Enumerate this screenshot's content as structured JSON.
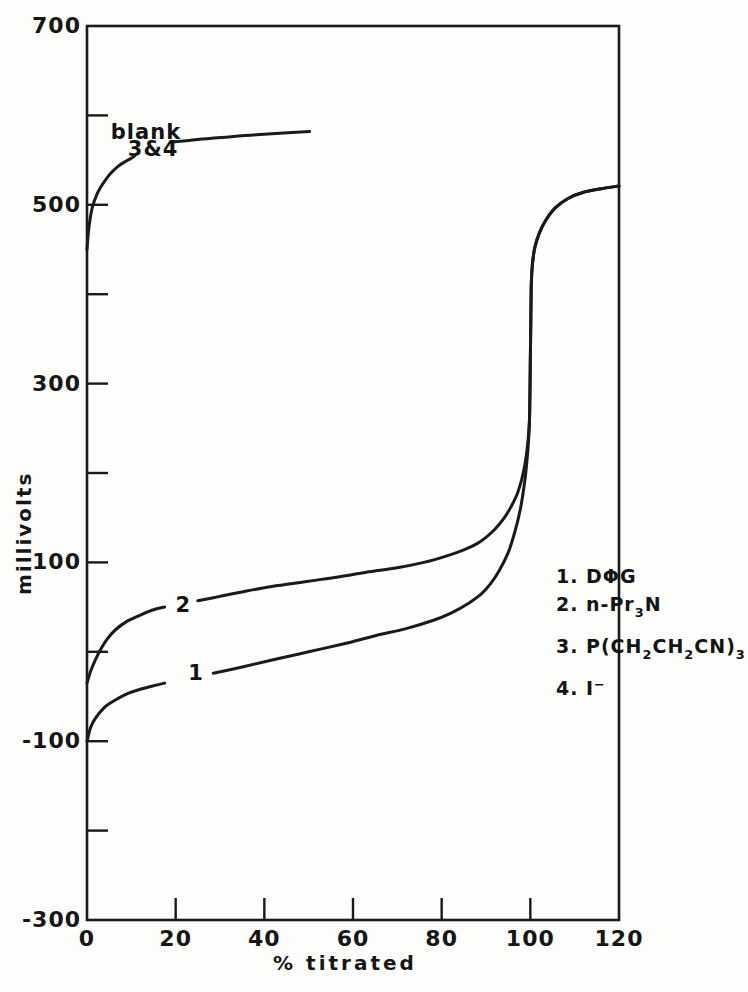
{
  "chart_data": {
    "type": "line",
    "title": "",
    "xlabel": "% titrated",
    "ylabel": "millivolts",
    "xlim": [
      0,
      120
    ],
    "ylim": [
      -300,
      700
    ],
    "grid": false,
    "x_tick_labels": [
      0,
      20,
      40,
      60,
      80,
      100,
      120
    ],
    "x_tick_marks": [
      20,
      40,
      60,
      80,
      100
    ],
    "y_tick_labels": [
      700,
      500,
      300,
      100,
      -100,
      -300
    ],
    "y_tick_marks": [
      600,
      500,
      400,
      300,
      200,
      100,
      0,
      -100,
      -200
    ],
    "series": [
      {
        "name": "blank (curves 3 & 4)",
        "segments": [
          [
            [
              0,
              450
            ],
            [
              0.3,
              468
            ],
            [
              0.7,
              484
            ],
            [
              1.2,
              497
            ],
            [
              2,
              509
            ],
            [
              3,
              519
            ],
            [
              4.2,
              528
            ],
            [
              5.5,
              536
            ],
            [
              7,
              543
            ],
            [
              8.5,
              548
            ],
            [
              10,
              552
            ],
            [
              10.8,
              555
            ]
          ],
          [
            [
              19.2,
              570
            ],
            [
              25,
              573
            ],
            [
              32,
              576
            ],
            [
              40,
              579
            ],
            [
              50.2,
              582
            ]
          ]
        ]
      },
      {
        "name": "curve 2 (n-Pr3N)",
        "segments": [
          [
            [
              0,
              -35
            ],
            [
              0.8,
              -22
            ],
            [
              1.8,
              -10
            ],
            [
              3,
              2
            ],
            [
              4.5,
              14
            ],
            [
              6.5,
              25
            ],
            [
              9,
              34
            ],
            [
              12,
              41
            ],
            [
              15,
              47
            ],
            [
              17.5,
              50
            ]
          ],
          [
            [
              25,
              57
            ],
            [
              30,
              62
            ],
            [
              36,
              68
            ],
            [
              43,
              74
            ],
            [
              50,
              79
            ],
            [
              57,
              84
            ],
            [
              63,
              89
            ],
            [
              70,
              94
            ],
            [
              76,
              100
            ],
            [
              81,
              107
            ],
            [
              85,
              114
            ],
            [
              88,
              121
            ],
            [
              90,
              128
            ],
            [
              92,
              137
            ],
            [
              94,
              149
            ],
            [
              95.5,
              161
            ],
            [
              97,
              176
            ],
            [
              98,
              192
            ],
            [
              98.8,
              210
            ],
            [
              99.4,
              232
            ],
            [
              99.8,
              258
            ],
            [
              99.9,
              285
            ],
            [
              100,
              325
            ],
            [
              100.1,
              368
            ],
            [
              100.2,
              408
            ],
            [
              100.45,
              432
            ],
            [
              101,
              452
            ],
            [
              102,
              468
            ],
            [
              103.5,
              483
            ],
            [
              105.5,
              496
            ],
            [
              108.5,
              507
            ],
            [
              112,
              514
            ],
            [
              116,
              518
            ],
            [
              120,
              521
            ]
          ]
        ]
      },
      {
        "name": "curve 1 (DPhiG)",
        "segments": [
          [
            [
              0,
              -100
            ],
            [
              0.8,
              -85
            ],
            [
              1.8,
              -75
            ],
            [
              4,
              -62
            ],
            [
              6,
              -55
            ],
            [
              9,
              -47
            ],
            [
              12,
              -42
            ],
            [
              15,
              -38
            ],
            [
              17.5,
              -35
            ]
          ],
          [
            [
              28.5,
              -24
            ],
            [
              35,
              -17
            ],
            [
              42,
              -9
            ],
            [
              50,
              0
            ],
            [
              58,
              9
            ],
            [
              65,
              18
            ],
            [
              72,
              26
            ],
            [
              78,
              35
            ],
            [
              82,
              43
            ],
            [
              86,
              54
            ],
            [
              89,
              65
            ],
            [
              91,
              76
            ],
            [
              93,
              91
            ],
            [
              95,
              111
            ],
            [
              96.5,
              134
            ],
            [
              97.8,
              161
            ],
            [
              98.8,
              193
            ],
            [
              99.4,
              223
            ],
            [
              99.8,
              256
            ],
            [
              99.9,
              285
            ],
            [
              100,
              325
            ],
            [
              100.1,
              368
            ],
            [
              100.2,
              408
            ],
            [
              100.45,
              432
            ],
            [
              101,
              452
            ],
            [
              102,
              468
            ],
            [
              103.5,
              483
            ],
            [
              105.5,
              496
            ],
            [
              108.5,
              507
            ],
            [
              112,
              514
            ],
            [
              116,
              518
            ],
            [
              120,
              521
            ]
          ]
        ]
      }
    ],
    "annotations": [
      {
        "id": "blank-label",
        "text": "blank",
        "x": 13.3,
        "y": 580
      },
      {
        "id": "three-and-four-label",
        "text": "3&4",
        "x": 14.9,
        "y": 561
      },
      {
        "id": "curve-2-label",
        "text": "2",
        "x": 21.7,
        "y": 51
      },
      {
        "id": "curve-1-label",
        "text": "1",
        "x": 24.6,
        "y": -25
      }
    ],
    "legend": {
      "position": "right-middle",
      "items": [
        {
          "num": "1.",
          "tokens": [
            {
              "t": "DΦG",
              "s": "n"
            }
          ]
        },
        {
          "num": "2.",
          "tokens": [
            {
              "t": "n-Pr",
              "s": "n"
            },
            {
              "t": "3",
              "s": "sub"
            },
            {
              "t": "N",
              "s": "n"
            }
          ]
        },
        {
          "num": "3.",
          "tokens": [
            {
              "t": "P(CH",
              "s": "n"
            },
            {
              "t": "2",
              "s": "sub"
            },
            {
              "t": "CH",
              "s": "n"
            },
            {
              "t": "2",
              "s": "sub"
            },
            {
              "t": "CN)",
              "s": "n"
            },
            {
              "t": "3",
              "s": "sub"
            }
          ]
        },
        {
          "num": "4.",
          "tokens": [
            {
              "t": "I",
              "s": "n"
            },
            {
              "t": "−",
              "s": "sup"
            }
          ]
        }
      ]
    },
    "line_color": "#1a1a1a"
  }
}
